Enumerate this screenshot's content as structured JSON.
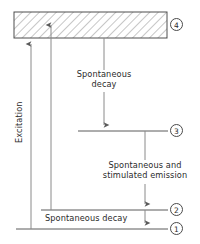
{
  "figure": {
    "background_color": "#ffffff",
    "line_color": "#5a5a5a",
    "text_color": "#2b2b2b",
    "hatch_color": "#8a8a8a"
  },
  "band": {
    "name": "pump-band",
    "fill": "hatched",
    "x": 14,
    "y": 12,
    "width": 153,
    "height": 26
  },
  "levels": [
    {
      "id": "4",
      "label": "4",
      "y": 12,
      "x_start": 14,
      "x_end": 167,
      "badge_x": 170,
      "badge_y": 18
    },
    {
      "id": "3",
      "label": "3",
      "y": 131,
      "x_start": 78,
      "x_end": 168,
      "badge_x": 170,
      "badge_y": 124
    },
    {
      "id": "2",
      "label": "2",
      "y": 210,
      "x_start": 41,
      "x_end": 168,
      "badge_x": 170,
      "badge_y": 203
    },
    {
      "id": "1",
      "label": "1",
      "y": 229,
      "x_start": 16,
      "x_end": 168,
      "badge_x": 170,
      "badge_y": 222
    }
  ],
  "labels": {
    "excitation": "Excitation",
    "spontaneous_decay_upper_line1": "Spontaneous",
    "spontaneous_decay_upper_line2": "decay",
    "emission_line1": "Spontaneous and",
    "emission_line2": "stimulated emission",
    "spontaneous_decay_lower": "Spontaneous decay"
  },
  "arrows": [
    {
      "name": "excitation-arrow-from-ground",
      "direction": "up",
      "x": 31,
      "y_from": 229,
      "y_to": 38
    },
    {
      "name": "excitation-arrow-from-level-2",
      "direction": "up",
      "x": 51,
      "y_from": 210,
      "y_to": 19
    },
    {
      "name": "spontaneous-decay-arrow-band-to-3",
      "direction": "down",
      "x": 104,
      "y_from": 38,
      "y_to": 131
    },
    {
      "name": "emission-arrow-3-to-2",
      "direction": "down",
      "x": 145,
      "y_from": 131,
      "y_to": 210
    },
    {
      "name": "spontaneous-decay-arrow-2-to-1",
      "direction": "down",
      "x": 145,
      "y_from": 210,
      "y_to": 229
    }
  ]
}
